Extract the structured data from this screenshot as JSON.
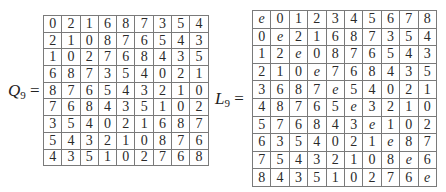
{
  "q9": {
    "label_var": "Q",
    "label_sub": "9",
    "label_eq": " =",
    "rows": [
      [
        "0",
        "2",
        "1",
        "6",
        "8",
        "7",
        "3",
        "5",
        "4"
      ],
      [
        "2",
        "1",
        "0",
        "8",
        "7",
        "6",
        "5",
        "4",
        "3"
      ],
      [
        "1",
        "0",
        "2",
        "7",
        "6",
        "8",
        "4",
        "3",
        "5"
      ],
      [
        "6",
        "8",
        "7",
        "3",
        "5",
        "4",
        "0",
        "2",
        "1"
      ],
      [
        "8",
        "7",
        "6",
        "5",
        "4",
        "3",
        "2",
        "1",
        "0"
      ],
      [
        "7",
        "6",
        "8",
        "4",
        "3",
        "5",
        "1",
        "0",
        "2"
      ],
      [
        "3",
        "5",
        "4",
        "0",
        "2",
        "1",
        "6",
        "8",
        "7"
      ],
      [
        "5",
        "4",
        "3",
        "2",
        "1",
        "0",
        "8",
        "7",
        "6"
      ],
      [
        "4",
        "3",
        "5",
        "1",
        "0",
        "2",
        "7",
        "6",
        "8"
      ]
    ]
  },
  "l9": {
    "label_var": "L",
    "label_sub": "9",
    "label_eq": " =",
    "rows": [
      [
        "e",
        "0",
        "1",
        "2",
        "3",
        "4",
        "5",
        "6",
        "7",
        "8"
      ],
      [
        "0",
        "e",
        "2",
        "1",
        "6",
        "8",
        "7",
        "3",
        "5",
        "4"
      ],
      [
        "1",
        "2",
        "e",
        "0",
        "8",
        "7",
        "6",
        "5",
        "4",
        "3"
      ],
      [
        "2",
        "1",
        "0",
        "e",
        "7",
        "6",
        "8",
        "4",
        "3",
        "5"
      ],
      [
        "3",
        "6",
        "8",
        "7",
        "e",
        "5",
        "4",
        "0",
        "2",
        "1"
      ],
      [
        "4",
        "8",
        "7",
        "6",
        "5",
        "e",
        "3",
        "2",
        "1",
        "0"
      ],
      [
        "5",
        "7",
        "6",
        "8",
        "4",
        "3",
        "e",
        "1",
        "0",
        "2"
      ],
      [
        "6",
        "3",
        "5",
        "4",
        "0",
        "2",
        "1",
        "e",
        "8",
        "7"
      ],
      [
        "7",
        "5",
        "4",
        "3",
        "2",
        "1",
        "0",
        "8",
        "e",
        "6"
      ],
      [
        "8",
        "4",
        "3",
        "5",
        "1",
        "0",
        "2",
        "7",
        "6",
        "e"
      ]
    ]
  }
}
